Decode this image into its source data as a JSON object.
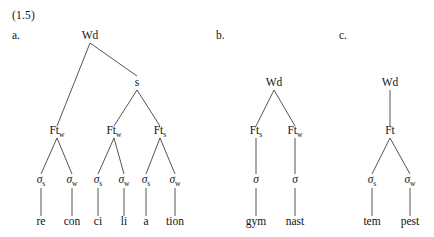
{
  "example_number": "(1.5)",
  "trees": [
    {
      "label": "a.",
      "word": "reconciliation",
      "nodes": [
        {
          "id": "a-wd",
          "text": "Wd",
          "sub": "",
          "x": 90,
          "y": 39,
          "kind": "prosodic-word"
        },
        {
          "id": "a-s",
          "text": "s",
          "sub": "",
          "x": 137,
          "y": 86,
          "kind": "strong-node"
        },
        {
          "id": "a-ft1",
          "text": "Ft",
          "sub": "w",
          "x": 57,
          "y": 134,
          "kind": "foot"
        },
        {
          "id": "a-ft2",
          "text": "Ft",
          "sub": "w",
          "x": 114,
          "y": 134,
          "kind": "foot"
        },
        {
          "id": "a-ft3",
          "text": "Ft",
          "sub": "s",
          "x": 160,
          "y": 134,
          "kind": "foot"
        },
        {
          "id": "a-sig1",
          "text": "σ",
          "sub": "s",
          "x": 41,
          "y": 183,
          "kind": "syllable"
        },
        {
          "id": "a-sig2",
          "text": "σ",
          "sub": "w",
          "x": 72,
          "y": 183,
          "kind": "syllable"
        },
        {
          "id": "a-sig3",
          "text": "σ",
          "sub": "s",
          "x": 98,
          "y": 183,
          "kind": "syllable"
        },
        {
          "id": "a-sig4",
          "text": "σ",
          "sub": "w",
          "x": 124,
          "y": 183,
          "kind": "syllable"
        },
        {
          "id": "a-sig5",
          "text": "σ",
          "sub": "s",
          "x": 146,
          "y": 183,
          "kind": "syllable"
        },
        {
          "id": "a-sig6",
          "text": "σ",
          "sub": "w",
          "x": 175,
          "y": 183,
          "kind": "syllable"
        },
        {
          "id": "a-lf1",
          "text": "re",
          "sub": "",
          "x": 41,
          "y": 225,
          "kind": "leaf"
        },
        {
          "id": "a-lf2",
          "text": "con",
          "sub": "",
          "x": 72,
          "y": 225,
          "kind": "leaf"
        },
        {
          "id": "a-lf3",
          "text": "ci",
          "sub": "",
          "x": 98,
          "y": 225,
          "kind": "leaf"
        },
        {
          "id": "a-lf4",
          "text": "li",
          "sub": "",
          "x": 124,
          "y": 225,
          "kind": "leaf"
        },
        {
          "id": "a-lf5",
          "text": "a",
          "sub": "",
          "x": 146,
          "y": 225,
          "kind": "leaf"
        },
        {
          "id": "a-lf6",
          "text": "tion",
          "sub": "",
          "x": 175,
          "y": 225,
          "kind": "leaf"
        }
      ],
      "edges": [
        {
          "x1": 90,
          "y1": 43,
          "x2": 57,
          "y2": 126
        },
        {
          "x1": 90,
          "y1": 43,
          "x2": 137,
          "y2": 76
        },
        {
          "x1": 137,
          "y1": 90,
          "x2": 114,
          "y2": 126
        },
        {
          "x1": 137,
          "y1": 90,
          "x2": 160,
          "y2": 126
        },
        {
          "x1": 57,
          "y1": 138,
          "x2": 41,
          "y2": 174
        },
        {
          "x1": 57,
          "y1": 138,
          "x2": 72,
          "y2": 174
        },
        {
          "x1": 114,
          "y1": 138,
          "x2": 98,
          "y2": 174
        },
        {
          "x1": 114,
          "y1": 138,
          "x2": 124,
          "y2": 174
        },
        {
          "x1": 160,
          "y1": 138,
          "x2": 146,
          "y2": 174
        },
        {
          "x1": 160,
          "y1": 138,
          "x2": 175,
          "y2": 174
        },
        {
          "x1": 41,
          "y1": 188,
          "x2": 41,
          "y2": 216
        },
        {
          "x1": 72,
          "y1": 188,
          "x2": 72,
          "y2": 216
        },
        {
          "x1": 98,
          "y1": 188,
          "x2": 98,
          "y2": 216
        },
        {
          "x1": 124,
          "y1": 188,
          "x2": 124,
          "y2": 216
        },
        {
          "x1": 146,
          "y1": 188,
          "x2": 146,
          "y2": 216
        },
        {
          "x1": 175,
          "y1": 188,
          "x2": 175,
          "y2": 216
        }
      ]
    },
    {
      "label": "b.",
      "word": "gymnast",
      "nodes": [
        {
          "id": "b-wd",
          "text": "Wd",
          "sub": "",
          "x": 274,
          "y": 86,
          "kind": "prosodic-word"
        },
        {
          "id": "b-ft1",
          "text": "Ft",
          "sub": "s",
          "x": 256,
          "y": 134,
          "kind": "foot"
        },
        {
          "id": "b-ft2",
          "text": "Ft",
          "sub": "w",
          "x": 295,
          "y": 134,
          "kind": "foot"
        },
        {
          "id": "b-sig1",
          "text": "σ",
          "sub": "",
          "x": 256,
          "y": 183,
          "kind": "syllable"
        },
        {
          "id": "b-sig2",
          "text": "σ",
          "sub": "",
          "x": 295,
          "y": 183,
          "kind": "syllable"
        },
        {
          "id": "b-lf1",
          "text": "gym",
          "sub": "",
          "x": 256,
          "y": 225,
          "kind": "leaf"
        },
        {
          "id": "b-lf2",
          "text": "nast",
          "sub": "",
          "x": 295,
          "y": 225,
          "kind": "leaf"
        }
      ],
      "edges": [
        {
          "x1": 274,
          "y1": 90,
          "x2": 256,
          "y2": 126
        },
        {
          "x1": 274,
          "y1": 90,
          "x2": 295,
          "y2": 126
        },
        {
          "x1": 256,
          "y1": 138,
          "x2": 256,
          "y2": 174
        },
        {
          "x1": 295,
          "y1": 138,
          "x2": 295,
          "y2": 174
        },
        {
          "x1": 256,
          "y1": 188,
          "x2": 256,
          "y2": 216
        },
        {
          "x1": 295,
          "y1": 188,
          "x2": 295,
          "y2": 216
        }
      ]
    },
    {
      "label": "c.",
      "word": "tempest",
      "nodes": [
        {
          "id": "c-wd",
          "text": "Wd",
          "sub": "",
          "x": 390,
          "y": 86,
          "kind": "prosodic-word"
        },
        {
          "id": "c-ft1",
          "text": "Ft",
          "sub": "",
          "x": 390,
          "y": 134,
          "kind": "foot"
        },
        {
          "id": "c-sig1",
          "text": "σ",
          "sub": "s",
          "x": 372,
          "y": 183,
          "kind": "syllable"
        },
        {
          "id": "c-sig2",
          "text": "σ",
          "sub": "w",
          "x": 410,
          "y": 183,
          "kind": "syllable"
        },
        {
          "id": "c-lf1",
          "text": "tem",
          "sub": "",
          "x": 372,
          "y": 225,
          "kind": "leaf"
        },
        {
          "id": "c-lf2",
          "text": "pest",
          "sub": "",
          "x": 410,
          "y": 225,
          "kind": "leaf"
        }
      ],
      "edges": [
        {
          "x1": 390,
          "y1": 90,
          "x2": 390,
          "y2": 126
        },
        {
          "x1": 390,
          "y1": 138,
          "x2": 372,
          "y2": 174
        },
        {
          "x1": 390,
          "y1": 138,
          "x2": 410,
          "y2": 174
        },
        {
          "x1": 372,
          "y1": 188,
          "x2": 372,
          "y2": 216
        },
        {
          "x1": 410,
          "y1": 188,
          "x2": 410,
          "y2": 216
        }
      ]
    }
  ],
  "colors": {
    "background": "#ffffff",
    "ink": "#121212",
    "line": "#2a2a2a"
  }
}
